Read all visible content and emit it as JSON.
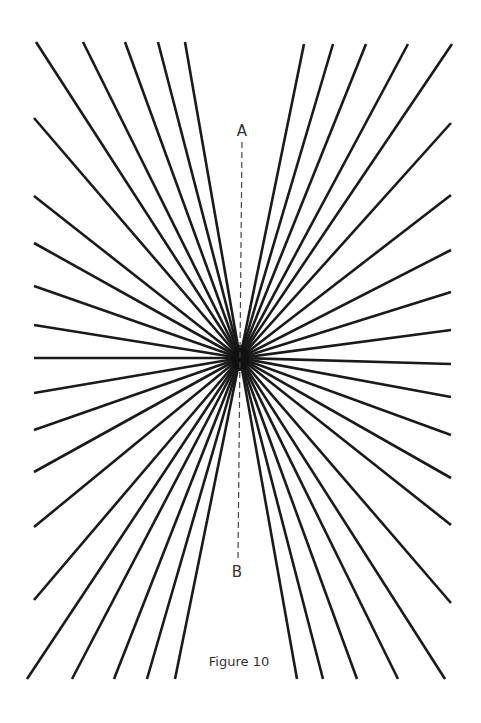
{
  "figure": {
    "caption": "Figure 10",
    "label_top": "A",
    "label_bottom": "B",
    "ray_color": "#1a1a1a",
    "background": "#ffffff",
    "center": [
      240,
      358
    ],
    "dashed_line": {
      "x_top": 242,
      "y_top": 142,
      "x_bottom": 238,
      "y_bottom": 560
    },
    "ray_endpoints": {
      "top_left": {
        "y": 42,
        "x": [
          36,
          83,
          125,
          158,
          185
        ]
      },
      "top_right": {
        "y": 44,
        "x": [
          304,
          333,
          366,
          408,
          452
        ]
      },
      "left_edge": {
        "x": 34,
        "y": [
          118,
          196,
          243,
          286,
          325,
          358,
          393,
          430,
          472,
          527,
          600
        ]
      },
      "right_edge": {
        "x": 451,
        "y": [
          123,
          195,
          250,
          292,
          330,
          364,
          397,
          435,
          478,
          525,
          603
        ]
      },
      "bottom_left": {
        "y": 679,
        "x": [
          27,
          72,
          114,
          147,
          175
        ]
      },
      "bottom_right": {
        "y": 679,
        "x": [
          297,
          323,
          357,
          398,
          445
        ]
      }
    }
  }
}
